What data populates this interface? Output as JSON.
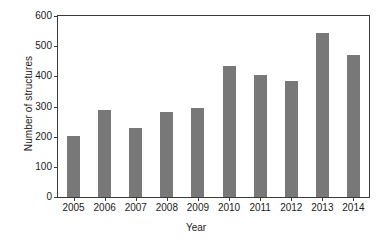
{
  "chart_data": {
    "type": "bar",
    "title": "",
    "xlabel": "Year",
    "ylabel": "Number of structures",
    "categories": [
      "2005",
      "2006",
      "2007",
      "2008",
      "2009",
      "2010",
      "2011",
      "2012",
      "2013",
      "2014"
    ],
    "values": [
      202,
      288,
      228,
      281,
      296,
      434,
      403,
      386,
      545,
      470
    ],
    "ylim": [
      0,
      600
    ],
    "yticks": [
      0,
      100,
      200,
      300,
      400,
      500,
      600
    ],
    "ytick_labels": [
      "0",
      "100",
      "200",
      "300",
      "400",
      "500",
      "600"
    ],
    "grid": false,
    "legend": null,
    "bar_color": "#787878",
    "axis_color": "#3a3a3a",
    "background": "#ffffff"
  }
}
